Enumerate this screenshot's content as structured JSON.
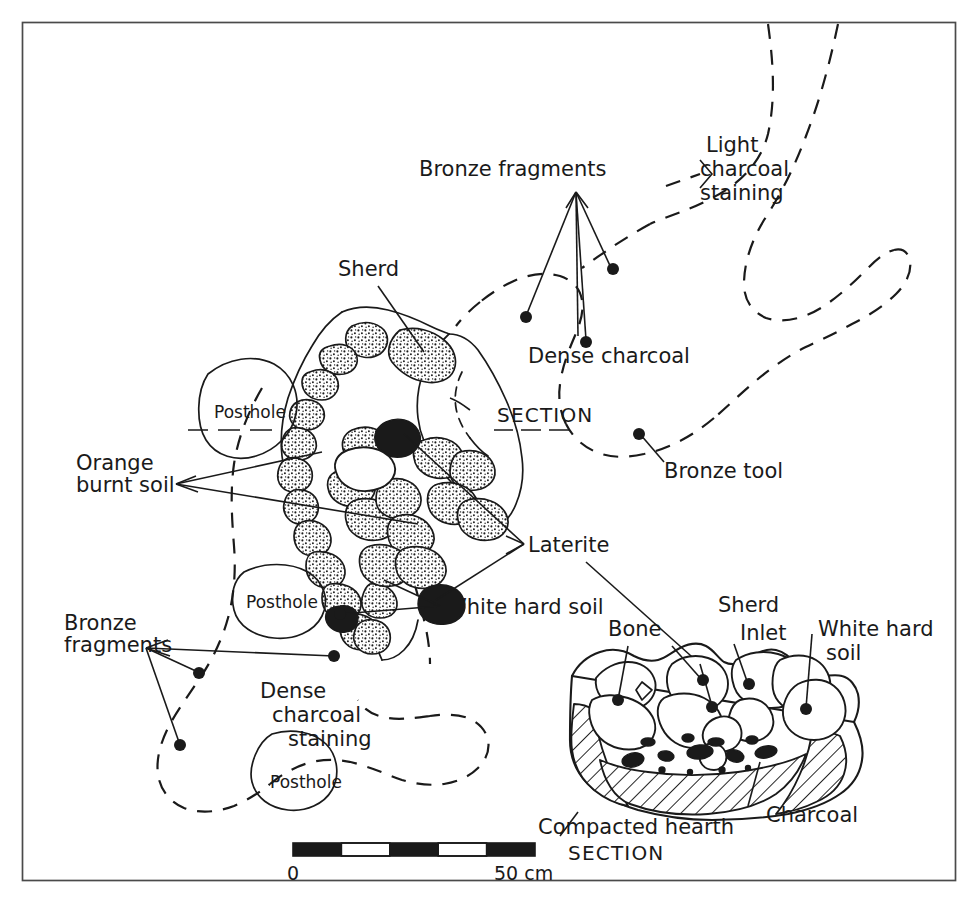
{
  "figure": {
    "type": "archaeological-site-plan",
    "plan_caption": "SECTION",
    "section_marker": "SECTION"
  },
  "labels": {
    "bronze_fragments_top": "Bronze fragments",
    "light_charcoal_staining": "Light\ncharcoal\nstaining",
    "light_charcoal_l1": "Light",
    "light_charcoal_l2": "charcoal",
    "light_charcoal_l3": "staining",
    "sherd_top": "Sherd",
    "dense_charcoal": "Dense charcoal",
    "section_marker_plan": "SECTION",
    "bronze_tool": "Bronze tool",
    "posthole_1": "Posthole",
    "posthole_2": "Posthole",
    "posthole_3": "Posthole",
    "orange_burnt_soil_l1": "Orange",
    "orange_burnt_soil_l2": "burnt soil",
    "laterite": "Laterite",
    "white_hard_soil_plan": "White hard soil",
    "bronze_fragments_left_l1": "Bronze",
    "bronze_fragments_left_l2": "fragments",
    "dense_charcoal_staining_l1": "Dense",
    "dense_charcoal_staining_l2": "charcoal",
    "dense_charcoal_staining_l3": "staining",
    "bone": "Bone",
    "sherd_section": "Sherd",
    "inlet": "Inlet",
    "white_hard_soil_section_l1": "White hard",
    "white_hard_soil_section_l2": "soil",
    "compacted_hearth": "Compacted hearth",
    "charcoal": "Charcoal",
    "section_caption": "SECTION"
  },
  "scale": {
    "start": "0",
    "end": "50 cm",
    "segments": 5,
    "segment_cm": 10,
    "total_cm": 50
  },
  "colors": {
    "ink": "#1a1a1a",
    "frame": "#4a4a4a",
    "paper": "#ffffff"
  }
}
